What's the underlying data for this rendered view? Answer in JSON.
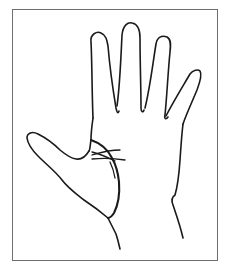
{
  "figure": {
    "frame": {
      "border_color": "#6e6e6e",
      "background": "#ffffff"
    },
    "stroke_color": "#1a1a1a",
    "parts": [
      "thumb",
      "index-finger",
      "middle-finger",
      "ring-finger",
      "little-finger",
      "palm-outline",
      "life-line",
      "crossing-lines"
    ]
  }
}
